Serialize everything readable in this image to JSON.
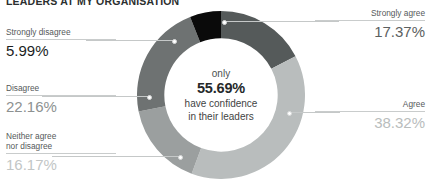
{
  "title": "LEADERS AT MY ORGANISATION",
  "center": {
    "line1": "only",
    "value": "55.69%",
    "line3": "have confidence",
    "line4": "in their leaders"
  },
  "callouts": {
    "strongly_agree": {
      "label": "Strongly agree",
      "value": "17.37%"
    },
    "agree": {
      "label": "Agree",
      "value": "38.32%"
    },
    "neither_line1": "Neither agree",
    "neither_line2": "nor disagree",
    "neither_value": "16.17%",
    "disagree": {
      "label": "Disagree",
      "value": "22.16%"
    },
    "strongly_disagree": {
      "label": "Strongly disagree",
      "value": "5.99%"
    }
  },
  "chart_data": {
    "type": "pie",
    "variant": "donut",
    "title": "LEADERS AT MY ORGANISATION",
    "center_annotation": "only 55.69% have confidence in their leaders",
    "center_value": 55.69,
    "unit": "%",
    "start_angle_deg": 0,
    "direction": "clockwise",
    "inner_radius_ratio": 0.675,
    "legend": "callout-labels",
    "categories": [
      "Strongly agree",
      "Agree",
      "Neither agree nor disagree",
      "Disagree",
      "Strongly disagree"
    ],
    "values": [
      17.37,
      38.32,
      16.17,
      22.16,
      5.99
    ],
    "value_labels": [
      "17.37%",
      "38.32%",
      "16.17%",
      "22.16%",
      "5.99%"
    ],
    "colors": [
      "#555a5a",
      "#b9bdbd",
      "#9b9f9f",
      "#6e7272",
      "#0a0a0a"
    ],
    "series": [
      {
        "name": "Confidence in leaders at my organisation",
        "values": [
          17.37,
          38.32,
          16.17,
          22.16,
          5.99
        ]
      }
    ],
    "total": 100.01,
    "derived": {
      "confidence_sum_label": "55.69%",
      "confidence_sum_components": [
        "Strongly agree",
        "Agree"
      ]
    }
  },
  "colors": {
    "strongly_agree": "#555a5a",
    "agree": "#b9bdbd",
    "neither": "#9b9f9f",
    "disagree": "#6e7272",
    "strongly_disagree": "#0a0a0a",
    "rule": "#c9cccc",
    "background": "#ffffff"
  }
}
